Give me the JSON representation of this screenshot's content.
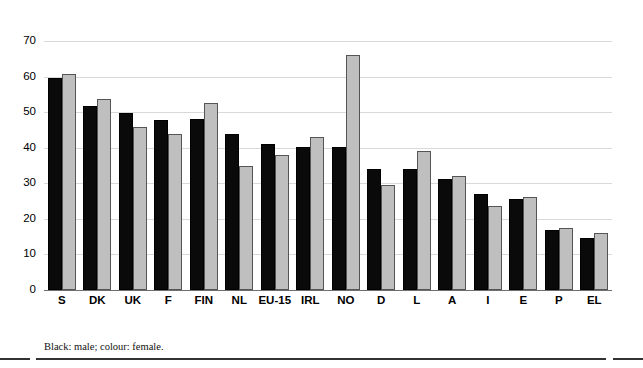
{
  "chart_data": {
    "type": "bar",
    "title": "",
    "xlabel": "",
    "ylabel": "",
    "ylim": [
      0,
      70
    ],
    "yticks": [
      0,
      10,
      20,
      30,
      40,
      50,
      60,
      70
    ],
    "grid": true,
    "legend_position": "below-plot-as-caption",
    "categories": [
      "S",
      "DK",
      "UK",
      "F",
      "FIN",
      "NL",
      "EU-15",
      "IRL",
      "NO",
      "D",
      "L",
      "A",
      "I",
      "E",
      "P",
      "EL"
    ],
    "series": [
      {
        "name": "male",
        "color": "#000000",
        "values": [
          59.7,
          51.6,
          49.7,
          47.8,
          48.0,
          44.0,
          41.0,
          40.1,
          40.2,
          34.0,
          34.0,
          31.2,
          27.0,
          25.5,
          17.0,
          14.5
        ]
      },
      {
        "name": "female",
        "color": "#bfbfbf",
        "values": [
          60.8,
          53.8,
          45.8,
          44.0,
          52.5,
          34.8,
          38.0,
          43.0,
          66.0,
          29.5,
          39.0,
          32.0,
          23.5,
          26.2,
          17.4,
          16.0
        ]
      }
    ],
    "annotations": [
      "Black: male; colour: female."
    ]
  },
  "caption": {
    "text": "Black: male; colour: female."
  },
  "axis": {
    "y_tick_labels": [
      "70",
      "60",
      "50",
      "40",
      "30",
      "20",
      "10",
      "0"
    ]
  }
}
